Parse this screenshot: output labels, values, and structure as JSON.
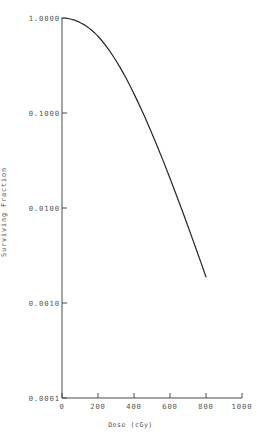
{
  "chart_data": {
    "type": "line",
    "title": "",
    "xlabel": "Dose (cGy)",
    "ylabel": "Surviving Fraction",
    "xlim": [
      0,
      1000
    ],
    "ylim": [
      0.0001,
      1.0
    ],
    "yscale": "log",
    "xscale": "linear",
    "grid": false,
    "legend": null,
    "xticks": [
      0,
      200,
      400,
      600,
      800,
      1000
    ],
    "xtick_labels": [
      "0",
      "200",
      "400",
      "600",
      "800",
      "1000"
    ],
    "yticks": [
      1.0,
      0.1,
      0.01,
      0.001,
      0.0001
    ],
    "ytick_labels": [
      "1.0000",
      "0.1000",
      "0.0100",
      "0.0010",
      "0.0001"
    ],
    "series": [
      {
        "name": "Surviving fraction",
        "color": "#2b2b2b",
        "x": [
          0,
          20,
          40,
          60,
          80,
          100,
          120,
          140,
          160,
          180,
          200,
          240,
          280,
          320,
          360,
          400,
          440,
          480,
          520,
          560,
          600,
          640,
          680,
          720,
          760,
          800
        ],
        "y": [
          1.0,
          0.995,
          0.982,
          0.961,
          0.933,
          0.898,
          0.856,
          0.808,
          0.756,
          0.7,
          0.642,
          0.522,
          0.408,
          0.308,
          0.225,
          0.159,
          0.11,
          0.0744,
          0.0493,
          0.0321,
          0.0206,
          0.013,
          0.00813,
          0.00503,
          0.00309,
          0.00188
        ]
      }
    ]
  },
  "axes": {
    "ytick_positions": [
      18,
      113,
      208,
      303,
      398
    ],
    "xtick_positions": [
      62,
      98,
      134,
      170,
      206,
      242
    ]
  }
}
